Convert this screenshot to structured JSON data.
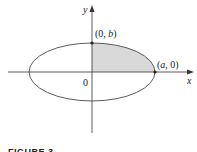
{
  "figure": {
    "caption": "FIGURE 3",
    "axes": {
      "x_label": "x",
      "y_label": "y",
      "origin_label": "0"
    },
    "points": [
      {
        "label_prefix": "(0, ",
        "label_var": "b",
        "label_suffix": ")",
        "name": "top-vertex"
      },
      {
        "label_prefix": "(",
        "label_var": "a",
        "label_suffix": ", 0)",
        "name": "right-vertex"
      }
    ],
    "shape": "ellipse x^2/a^2 + y^2/b^2 = 1",
    "shaded_region": "first quadrant of ellipse",
    "colors": {
      "stroke": "#333333",
      "shade": "#d9d9d9",
      "background": "#ffffff"
    }
  }
}
